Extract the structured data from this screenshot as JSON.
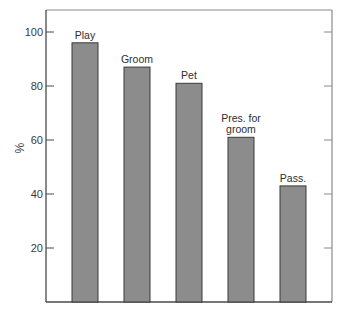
{
  "chart_data": {
    "type": "bar",
    "title": "",
    "xlabel": "",
    "ylabel": "%",
    "ylim": [
      0,
      106
    ],
    "yticks": [
      20,
      40,
      60,
      80,
      100
    ],
    "grid": false,
    "legend": null,
    "categories": [
      "Play",
      "Groom",
      "Pet",
      "Pres. for groom",
      "Pass."
    ],
    "bar_label_lines": [
      [
        "Play"
      ],
      [
        "Groom"
      ],
      [
        "Pet"
      ],
      [
        "Pres. for",
        "groom"
      ],
      [
        "Pass."
      ]
    ],
    "values": [
      96,
      87,
      81,
      61,
      43
    ],
    "colors": {
      "bar_fill": "#8c8c8c",
      "bar_edge": "#3a3a3a",
      "axis": "#4a4a4a",
      "frame": "#8a8a8a"
    }
  }
}
